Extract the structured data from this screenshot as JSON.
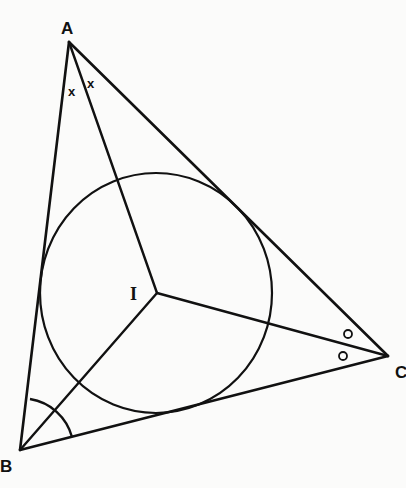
{
  "diagram": {
    "colors": {
      "stroke": "#111111",
      "background": "#fbfbfa"
    },
    "vertices": {
      "A": {
        "label": "A",
        "x": 69,
        "y": 42
      },
      "B": {
        "label": "B",
        "x": 20,
        "y": 450
      },
      "C": {
        "label": "C",
        "x": 388,
        "y": 356
      }
    },
    "incentre": {
      "label": "I",
      "x": 157,
      "y": 293
    },
    "incircle": {
      "cx": 156,
      "cy": 293,
      "rx": 116,
      "ry": 120
    },
    "angle_marks": {
      "A": {
        "symbol": "×",
        "count": 2
      },
      "B": {
        "symbol": "arc",
        "count": 1
      },
      "C": {
        "symbol": "o",
        "count": 2
      }
    },
    "labels": {
      "A": "A",
      "B": "B",
      "C": "C",
      "I": "I",
      "markA": "x",
      "markC": "o"
    }
  }
}
